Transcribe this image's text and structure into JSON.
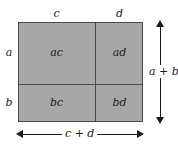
{
  "figure": {
    "type": "area-model-diagram",
    "fill_color": "#a8a8a8",
    "line_color": "#4a4a4a",
    "text_color": "#1a1a1a",
    "background_color": "#ffffff"
  },
  "cells": {
    "top_left": "ac",
    "top_right": "ad",
    "bottom_left": "bc",
    "bottom_right": "bd"
  },
  "edges": {
    "top_left_segment": "c",
    "top_right_segment": "d",
    "left_top_segment": "a",
    "left_bottom_segment": "b"
  },
  "dimensions": {
    "height_label": "a + b",
    "width_label": "c + d"
  },
  "icons": {
    "arrow_up": "arrow-up-icon",
    "arrow_down": "arrow-down-icon",
    "arrow_left": "arrow-left-icon",
    "arrow_right": "arrow-right-icon"
  }
}
